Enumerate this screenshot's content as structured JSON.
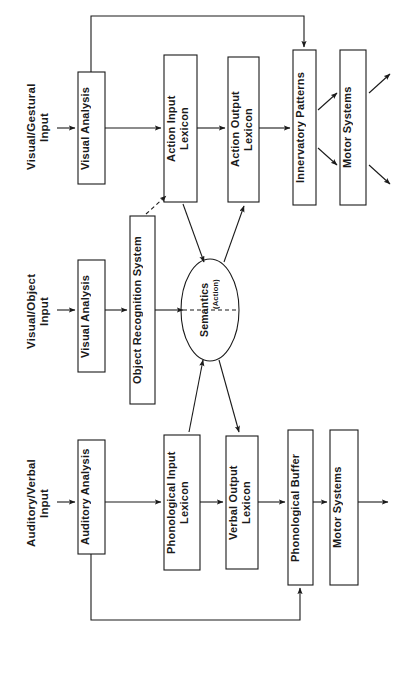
{
  "figure": {
    "type": "cognitive-model-block-diagram",
    "width": 398,
    "height": 673,
    "background_color": "#ffffff",
    "line_color": "#1a1a1a",
    "text_color": "#1a1a1a",
    "orientation": "rotated-90-ccw-text"
  },
  "inputs": [
    {
      "id": "visual-gestural-input",
      "label": "Visual/Gestural\nInput"
    },
    {
      "id": "visual-object-input",
      "label": "Visual/Object\nInput"
    },
    {
      "id": "auditory-verbal-input",
      "label": "Auditory/Verbal\nInput"
    }
  ],
  "boxes": [
    {
      "id": "visual-analysis-gestural",
      "label": "Visual Analysis",
      "row": "top"
    },
    {
      "id": "action-input-lexicon",
      "label": "Action Input\nLexicon",
      "row": "top"
    },
    {
      "id": "action-output-lexicon",
      "label": "Action Output\nLexicon",
      "row": "top"
    },
    {
      "id": "innervatory-patterns",
      "label": "Innervatory Patterns",
      "row": "top"
    },
    {
      "id": "motor-systems-top",
      "label": "Motor Systems",
      "row": "top"
    },
    {
      "id": "visual-analysis-object",
      "label": "Visual Analysis",
      "row": "middle"
    },
    {
      "id": "object-recognition-system",
      "label": "Object Recognition System",
      "row": "middle"
    },
    {
      "id": "auditory-analysis",
      "label": "Auditory Analysis",
      "row": "bottom"
    },
    {
      "id": "phonological-input-lexicon",
      "label": "Phonological Input\nLexicon",
      "row": "bottom"
    },
    {
      "id": "verbal-output-lexicon",
      "label": "Verbal Output\nLexicon",
      "row": "bottom"
    },
    {
      "id": "phonological-buffer",
      "label": "Phonological Buffer",
      "row": "bottom"
    },
    {
      "id": "motor-systems-bottom",
      "label": "Motor Systems",
      "row": "bottom"
    }
  ],
  "ellipse": {
    "id": "semantics",
    "label": "Semantics",
    "sublabel": "(Action)",
    "divider": "dashed"
  },
  "connections": [
    {
      "from": "visual-gestural-input",
      "to": "visual-analysis-gestural",
      "style": "solid"
    },
    {
      "from": "visual-analysis-gestural",
      "to": "action-input-lexicon",
      "style": "solid"
    },
    {
      "from": "action-input-lexicon",
      "to": "action-output-lexicon",
      "style": "solid"
    },
    {
      "from": "action-output-lexicon",
      "to": "innervatory-patterns",
      "style": "solid"
    },
    {
      "from": "innervatory-patterns",
      "to": "motor-systems-top",
      "style": "solid-diagonal"
    },
    {
      "from": "motor-systems-top",
      "to": "output",
      "style": "solid-diagonal"
    },
    {
      "from": "visual-analysis-gestural",
      "to": "innervatory-patterns",
      "style": "solid-feedback-loop"
    },
    {
      "from": "visual-object-input",
      "to": "visual-analysis-object",
      "style": "solid"
    },
    {
      "from": "visual-analysis-object",
      "to": "object-recognition-system",
      "style": "solid"
    },
    {
      "from": "object-recognition-system",
      "to": "semantics",
      "style": "solid"
    },
    {
      "from": "object-recognition-system",
      "to": "action-input-lexicon",
      "style": "dashed"
    },
    {
      "from": "action-input-lexicon",
      "to": "semantics",
      "style": "solid"
    },
    {
      "from": "semantics",
      "to": "action-output-lexicon",
      "style": "solid"
    },
    {
      "from": "phonological-input-lexicon",
      "to": "semantics",
      "style": "solid"
    },
    {
      "from": "semantics",
      "to": "verbal-output-lexicon",
      "style": "solid"
    },
    {
      "from": "auditory-verbal-input",
      "to": "auditory-analysis",
      "style": "solid"
    },
    {
      "from": "auditory-analysis",
      "to": "phonological-input-lexicon",
      "style": "solid"
    },
    {
      "from": "phonological-input-lexicon",
      "to": "verbal-output-lexicon",
      "style": "solid"
    },
    {
      "from": "verbal-output-lexicon",
      "to": "phonological-buffer",
      "style": "solid"
    },
    {
      "from": "phonological-buffer",
      "to": "motor-systems-bottom",
      "style": "solid"
    },
    {
      "from": "motor-systems-bottom",
      "to": "output",
      "style": "solid"
    },
    {
      "from": "auditory-analysis",
      "to": "phonological-buffer",
      "style": "solid-feedback-loop"
    }
  ]
}
